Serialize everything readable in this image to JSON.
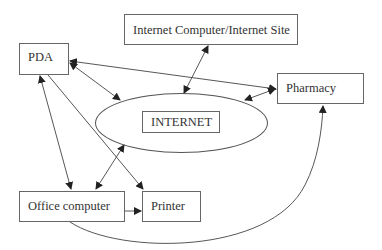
{
  "diagram": {
    "nodes": {
      "pda": {
        "label": "PDA"
      },
      "internet_site": {
        "label": "Internet Computer/Internet Site"
      },
      "pharmacy": {
        "label": "Pharmacy"
      },
      "internet": {
        "label": "INTERNET"
      },
      "office_computer": {
        "label": "Office computer"
      },
      "printer": {
        "label": "Printer"
      }
    },
    "edges": [
      {
        "from": "PDA",
        "to": "Pharmacy",
        "type": "bidirectional"
      },
      {
        "from": "PDA",
        "to": "INTERNET",
        "type": "bidirectional"
      },
      {
        "from": "Internet Computer/Internet Site",
        "to": "INTERNET",
        "type": "bidirectional"
      },
      {
        "from": "INTERNET",
        "to": "Pharmacy",
        "type": "bidirectional"
      },
      {
        "from": "PDA",
        "to": "Office computer",
        "type": "bidirectional"
      },
      {
        "from": "PDA",
        "to": "Printer",
        "type": "directed"
      },
      {
        "from": "Office computer",
        "to": "INTERNET",
        "type": "bidirectional"
      },
      {
        "from": "Office computer",
        "to": "Printer",
        "type": "directed"
      },
      {
        "from": "Office computer",
        "to": "Pharmacy",
        "type": "directed"
      }
    ]
  }
}
